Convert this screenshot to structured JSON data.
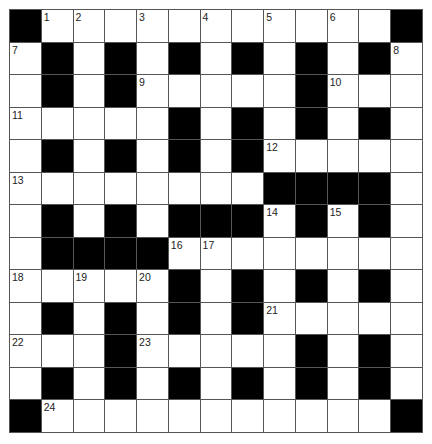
{
  "puzzle": {
    "type": "crossword",
    "rows": 13,
    "cols": 13,
    "colors": {
      "block": "#000000",
      "cell": "#ffffff",
      "grid_line": "#555555",
      "number": "#222222"
    },
    "grid": [
      "#...........#",
      ".#.#.#.#.#.#.",
      ".#.#.....#...",
      ".....#.#.#.#.",
      ".#.#.#.#.....",
      "........####.",
      ".#.#.###.#.#.",
      ".####........",
      ".....#.#.#.#.",
      ".#.#.#.#.....",
      "...#.....#.#.",
      ".#.#.#.#.#.#.",
      "#...........#"
    ],
    "numbers": [
      {
        "label": "1",
        "row": 0,
        "col": 1
      },
      {
        "label": "2",
        "row": 0,
        "col": 2
      },
      {
        "label": "3",
        "row": 0,
        "col": 4
      },
      {
        "label": "4",
        "row": 0,
        "col": 6
      },
      {
        "label": "5",
        "row": 0,
        "col": 8
      },
      {
        "label": "6",
        "row": 0,
        "col": 10
      },
      {
        "label": "7",
        "row": 1,
        "col": 0
      },
      {
        "label": "8",
        "row": 1,
        "col": 12
      },
      {
        "label": "9",
        "row": 2,
        "col": 4
      },
      {
        "label": "10",
        "row": 2,
        "col": 10
      },
      {
        "label": "11",
        "row": 3,
        "col": 0
      },
      {
        "label": "12",
        "row": 4,
        "col": 8
      },
      {
        "label": "13",
        "row": 5,
        "col": 0
      },
      {
        "label": "14",
        "row": 6,
        "col": 8
      },
      {
        "label": "15",
        "row": 6,
        "col": 10
      },
      {
        "label": "16",
        "row": 7,
        "col": 5
      },
      {
        "label": "17",
        "row": 7,
        "col": 6
      },
      {
        "label": "18",
        "row": 8,
        "col": 0
      },
      {
        "label": "19",
        "row": 8,
        "col": 2
      },
      {
        "label": "20",
        "row": 8,
        "col": 4
      },
      {
        "label": "21",
        "row": 9,
        "col": 8
      },
      {
        "label": "22",
        "row": 10,
        "col": 0
      },
      {
        "label": "23",
        "row": 10,
        "col": 4
      },
      {
        "label": "24",
        "row": 12,
        "col": 1
      }
    ]
  }
}
